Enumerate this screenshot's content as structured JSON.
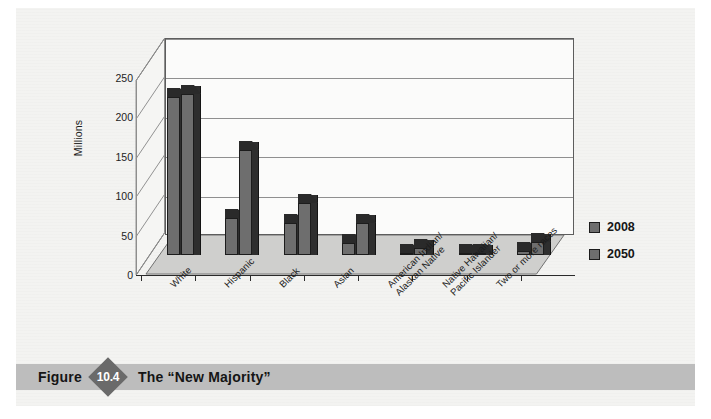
{
  "figure": {
    "label": "Figure",
    "number": "10.4",
    "title": "The “New Majority”"
  },
  "chart_data": {
    "type": "bar",
    "title": "",
    "subtitle": "",
    "xlabel": "",
    "ylabel": "Millions",
    "ylim": [
      0,
      250
    ],
    "yticks": [
      "0",
      "50",
      "100",
      "150",
      "200",
      "250"
    ],
    "grid": true,
    "legend_position": "right",
    "categories": [
      "White",
      "Hispanic",
      "Black",
      "Asian",
      "American Indian/\nAlaskan Native",
      "Native Hawaiian/\nPacific Islander",
      "Two or more races"
    ],
    "series": [
      {
        "name": "2008",
        "color": "#6e6e6e",
        "values": [
          200,
          47,
          41,
          15,
          3,
          1,
          5
        ]
      },
      {
        "name": "2050",
        "color": "#6e6e6e",
        "values": [
          204,
          133,
          66,
          41,
          9,
          3,
          17
        ]
      }
    ]
  },
  "legend": {
    "items": [
      {
        "label": "2008"
      },
      {
        "label": "2050"
      }
    ]
  },
  "colors": {
    "bar_front": "#6e6e6e",
    "bar_top": "#2a2a2a",
    "bar_side": "#2e2e2e",
    "plot_background": "#fbfbfa",
    "floor": "#cfcfcd",
    "caption_bar": "#bdbdbd",
    "diamond": "#6a6a6a",
    "page": "#f3f3f1"
  }
}
